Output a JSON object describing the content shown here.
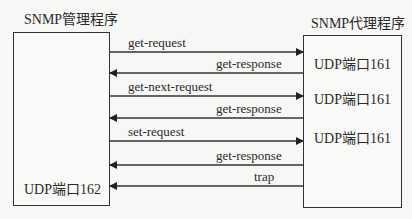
{
  "manager": {
    "title": "SNMP管理程序",
    "port": "UDP端口162"
  },
  "agent": {
    "title": "SNMP代理程序",
    "ports": [
      "UDP端口161",
      "UDP端口161",
      "UDP端口161"
    ]
  },
  "messages": [
    {
      "label": "get-request",
      "direction": "to-agent"
    },
    {
      "label": "get-response",
      "direction": "to-manager"
    },
    {
      "label": "get-next-request",
      "direction": "to-agent"
    },
    {
      "label": "get-response",
      "direction": "to-manager"
    },
    {
      "label": "set-request",
      "direction": "to-agent"
    },
    {
      "label": "get-response",
      "direction": "to-manager"
    },
    {
      "label": "trap",
      "direction": "to-manager"
    }
  ]
}
